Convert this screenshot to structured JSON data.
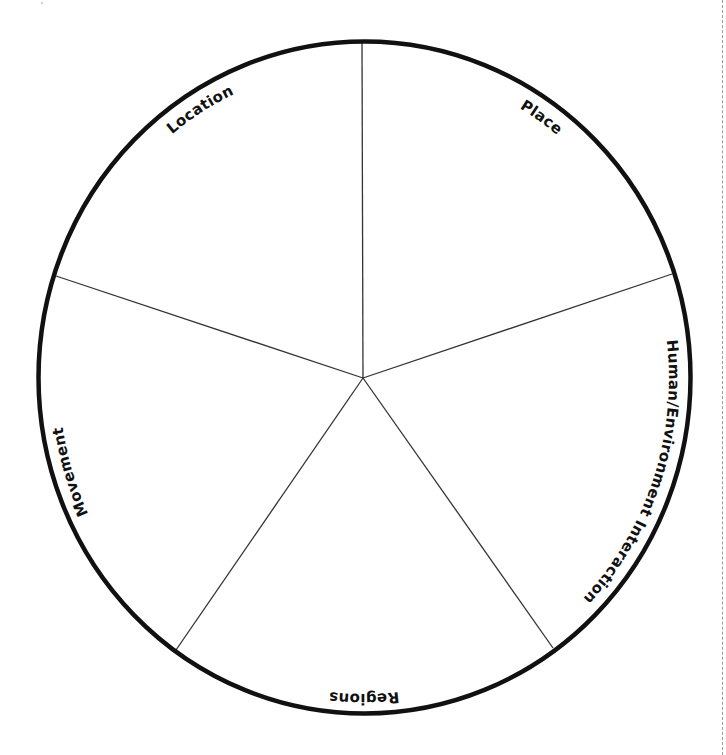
{
  "diagram": {
    "type": "pie-wheel",
    "segments": [
      {
        "label": "Location",
        "position": "upper-left"
      },
      {
        "label": "Place",
        "position": "upper-right"
      },
      {
        "label": "Human/Environment Interaction",
        "position": "right"
      },
      {
        "label": "Regions",
        "position": "bottom"
      },
      {
        "label": "Movement",
        "position": "left"
      }
    ],
    "colors": {
      "outline": "#111111",
      "divider": "#333333",
      "background": "#ffffff",
      "cut_line": "#9a9a9a"
    }
  }
}
